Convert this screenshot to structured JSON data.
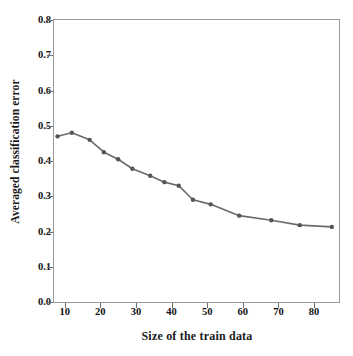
{
  "chart_data": {
    "type": "line",
    "title": "",
    "xlabel": "Size of the train data",
    "ylabel": "Averaged classification error",
    "xlim": [
      7,
      87
    ],
    "ylim": [
      0.0,
      0.8
    ],
    "xticks": [
      "10",
      "20",
      "30",
      "40",
      "50",
      "60",
      "70",
      "80"
    ],
    "xtick_values": [
      10,
      20,
      30,
      40,
      50,
      60,
      70,
      80
    ],
    "yticks": [
      "0.0",
      "0.1",
      "0.2",
      "0.3",
      "0.4",
      "0.5",
      "0.6",
      "0.7",
      "0.8"
    ],
    "ytick_values": [
      0.0,
      0.1,
      0.2,
      0.3,
      0.4,
      0.5,
      0.6,
      0.7,
      0.8
    ],
    "grid": false,
    "legend": null,
    "series": [
      {
        "name": "Averaged classification error",
        "color": "#6b6b6b",
        "marker": "circle",
        "x": [
          8,
          12,
          17,
          21,
          25,
          29,
          34,
          38,
          42,
          46,
          51,
          59,
          68,
          76,
          85
        ],
        "values": [
          0.47,
          0.48,
          0.46,
          0.425,
          0.405,
          0.378,
          0.358,
          0.34,
          0.33,
          0.29,
          0.277,
          0.245,
          0.232,
          0.218,
          0.213
        ]
      }
    ]
  },
  "style": {
    "line_color": "#6b6b6b",
    "marker_color": "#555555",
    "frame_color": "#9a9a9a",
    "text_color": "#111111",
    "background": "#ffffff"
  }
}
